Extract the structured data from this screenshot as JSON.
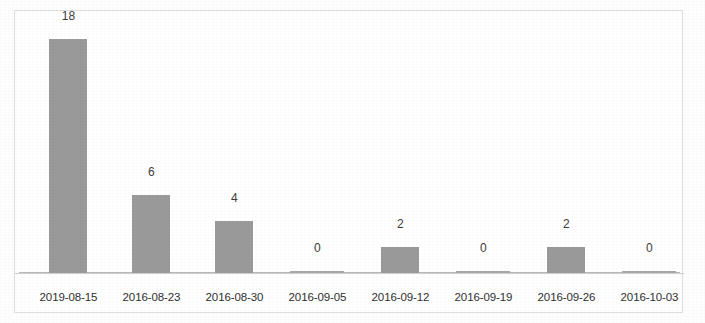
{
  "chart_data": {
    "type": "bar",
    "title": "",
    "subtitle": "",
    "xlabel": "",
    "ylabel": "",
    "categories": [
      "2019-08-15",
      "2016-08-23",
      "2016-08-30",
      "2016-09-05",
      "2016-09-12",
      "2016-09-19",
      "2016-09-26",
      "2016-10-03"
    ],
    "values": [
      18,
      6,
      4,
      0,
      2,
      0,
      2,
      0
    ],
    "value_labels": [
      "18",
      "6",
      "4",
      "0",
      "2",
      "0",
      "2",
      "0"
    ],
    "ylim": [
      0,
      18
    ],
    "grid": false,
    "legend": null,
    "legend_position": "none",
    "bar_color": "#9a9a9a",
    "axis_color": "#b9b9b9",
    "label_color": "#2f2f2f",
    "value_label_color": "#3d3d3d",
    "frame_color": "#dedede",
    "background_color": "#ffffff"
  }
}
